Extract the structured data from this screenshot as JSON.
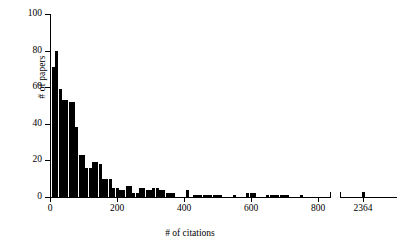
{
  "chart_data": {
    "type": "bar",
    "title": "",
    "subtitle": "",
    "xlabel": "# of citations",
    "ylabel": "# of papers",
    "grid": false,
    "legend": null,
    "xlim": [
      0,
      820
    ],
    "ylim": [
      0,
      100
    ],
    "ytick_labels": [
      "0",
      "20",
      "40",
      "60",
      "80",
      "100"
    ],
    "ytick_values": [
      0,
      20,
      40,
      60,
      80,
      100
    ],
    "xtick_labels": [
      "0",
      "200",
      "400",
      "600",
      "800",
      "2364"
    ],
    "xtick_values": [
      0,
      200,
      400,
      600,
      800,
      2364
    ],
    "axis_break": {
      "present": true,
      "after_value": 800,
      "resumes_label": "2364"
    },
    "bar_color": "#000000",
    "bin_width": 10,
    "categories": [
      10,
      20,
      30,
      40,
      50,
      60,
      70,
      80,
      90,
      100,
      110,
      120,
      130,
      140,
      150,
      160,
      170,
      180,
      190,
      200,
      210,
      220,
      230,
      240,
      250,
      260,
      270,
      280,
      290,
      300,
      310,
      320,
      330,
      340,
      350,
      360,
      370,
      410,
      430,
      440,
      450,
      460,
      470,
      480,
      490,
      500,
      510,
      550,
      590,
      600,
      610,
      650,
      660,
      670,
      680,
      690,
      700,
      710,
      750,
      2364
    ],
    "values": [
      71,
      80,
      59,
      53,
      53,
      52,
      52,
      38,
      23,
      23,
      16,
      16,
      19,
      19,
      18,
      10,
      10,
      10,
      5,
      5,
      4,
      4,
      6,
      6,
      2,
      2,
      5,
      5,
      4,
      4,
      5,
      5,
      4,
      4,
      2,
      2,
      2,
      4,
      1,
      1,
      1,
      1,
      1,
      1,
      1,
      1,
      1,
      1,
      2,
      2,
      2,
      1,
      1,
      1,
      1,
      1,
      1,
      1,
      1,
      3
    ],
    "series": [
      {
        "name": "# of papers",
        "values": [
          71,
          80,
          59,
          53,
          53,
          52,
          52,
          38,
          23,
          23,
          16,
          16,
          19,
          19,
          18,
          10,
          10,
          10,
          5,
          5,
          4,
          4,
          6,
          6,
          2,
          2,
          5,
          5,
          4,
          4,
          5,
          5,
          4,
          4,
          2,
          2,
          2,
          4,
          1,
          1,
          1,
          1,
          1,
          1,
          1,
          1,
          1,
          1,
          2,
          2,
          2,
          1,
          1,
          1,
          1,
          1,
          1,
          1,
          1,
          3
        ]
      }
    ]
  },
  "figure": {
    "background_color": "#ffffff",
    "foreground_color": "#000000"
  }
}
